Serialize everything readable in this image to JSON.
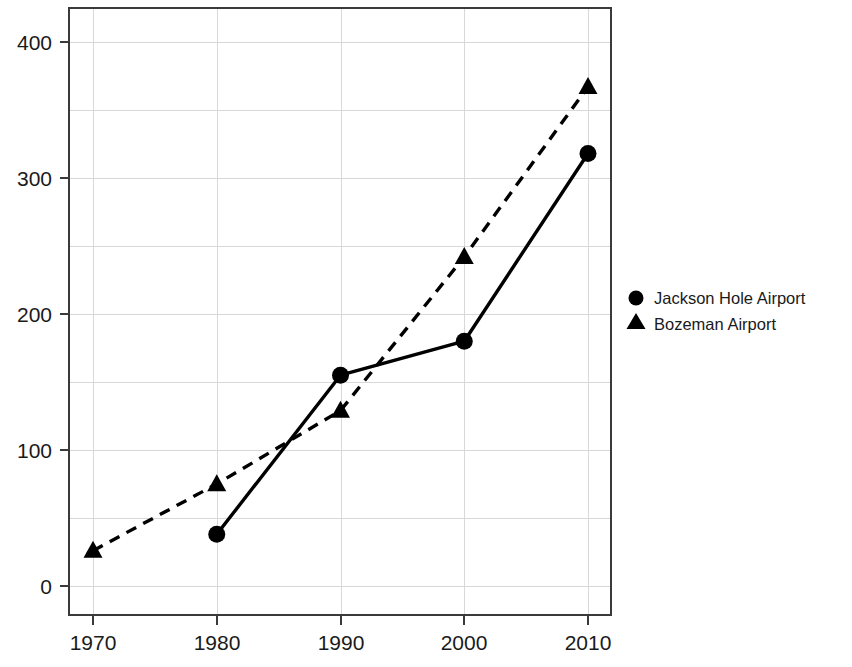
{
  "chart_data": {
    "type": "line",
    "title": "",
    "subtitle": "",
    "xlabel": "",
    "ylabel": "",
    "x": [
      1970,
      1980,
      1990,
      2000,
      2010
    ],
    "xticklabels": [
      "1970",
      "1980",
      "1990",
      "2000",
      "2010"
    ],
    "yticklabels": [
      "0",
      "100",
      "200",
      "300",
      "400"
    ],
    "yticks": [
      0,
      100,
      200,
      300,
      400
    ],
    "xlim": [
      1965,
      2015
    ],
    "ylim": [
      -10,
      420
    ],
    "grid": true,
    "grid_color": "#d8d8d8",
    "legend_position": "right",
    "series": [
      {
        "name": "Jackson Hole Airport",
        "marker": "circle",
        "linestyle": "solid",
        "color": "#000000",
        "x": [
          1980,
          1990,
          2000,
          2010
        ],
        "values": [
          38,
          155,
          180,
          318
        ]
      },
      {
        "name": "Bozeman Airport",
        "marker": "triangle",
        "linestyle": "dashed",
        "color": "#000000",
        "x": [
          1970,
          1980,
          1990,
          2000,
          2010
        ],
        "values": [
          26,
          75,
          129,
          242,
          367
        ]
      }
    ]
  },
  "axes": {
    "y_tick_0": "0",
    "y_tick_100": "100",
    "y_tick_200": "200",
    "y_tick_300": "300",
    "y_tick_400": "400",
    "x_tick_1970": "1970",
    "x_tick_1980": "1980",
    "x_tick_1990": "1990",
    "x_tick_2000": "2000",
    "x_tick_2010": "2010"
  },
  "legend": {
    "entries": [
      {
        "label": "Jackson Hole Airport",
        "marker_icon": "filled-circle-marker"
      },
      {
        "label": "Bozeman Airport",
        "marker_icon": "filled-triangle-marker"
      }
    ]
  }
}
